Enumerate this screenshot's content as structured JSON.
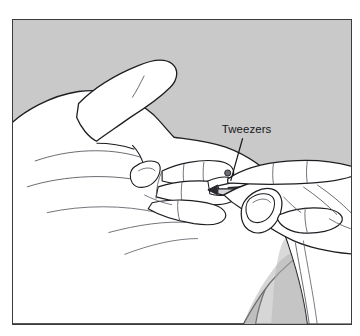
{
  "figure": {
    "kind": "line-art-illustration",
    "frame": {
      "border_color": "#3b3b3b",
      "background_color": "#c9c9c9",
      "page_background_color": "#ffffff",
      "border_width_px": 1.4,
      "x": 12,
      "y": 19,
      "width": 340,
      "height": 306
    },
    "ink": {
      "outline_color": "#1d1d22",
      "fill_color": "#ffffff",
      "shade_color": "#b4b4b4",
      "detail_color": "#5a5a62",
      "tool_dark_color": "#2a2a30"
    },
    "callouts": [
      {
        "id": "tweezers",
        "label": "Tweezers",
        "label_x": 222,
        "label_y": 133,
        "leader_from_x": 243,
        "leader_from_y": 138,
        "leader_to_x": 231,
        "leader_to_y": 181
      }
    ],
    "objects": [
      {
        "name": "left-hand",
        "description": "Open left hand, palm toward viewer, thumb raised upper-left, fingers extended to the right"
      },
      {
        "name": "right-hand",
        "description": "Right hand at lower right gripping the tweezers between thumb and index finger"
      },
      {
        "name": "tweezers",
        "description": "Long slender tweezers held horizontally, tips at the left hand's finger"
      },
      {
        "name": "splinter-site",
        "description": "Small dark point on the left hand's finger where the tweezer tips meet"
      }
    ]
  }
}
